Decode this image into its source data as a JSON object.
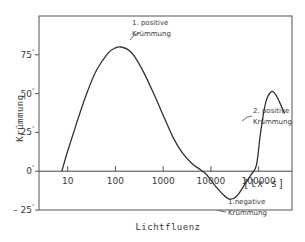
{
  "chart_data": {
    "type": "line",
    "title": "",
    "xlabel": "Lichtfluenz",
    "ylabel": "Krümmung",
    "x_unit": "[lx·s]",
    "x_scale": "log",
    "xlim": [
      2.5,
      500000
    ],
    "ylim": [
      -25,
      100
    ],
    "x_ticks": [
      10,
      100,
      1000,
      10000,
      100000
    ],
    "x_tick_labels": [
      "10",
      "100",
      "1000",
      "10000",
      "100000"
    ],
    "y_ticks": [
      -25,
      0,
      25,
      50,
      75
    ],
    "y_tick_labels": [
      "– 25",
      "0",
      "25",
      "50",
      "75"
    ],
    "y_tick_suffix": "°",
    "grid": false,
    "legend": "none",
    "series": [
      {
        "name": "Krümmung",
        "x": [
          7.5,
          10,
          15,
          25,
          40,
          70,
          100,
          130,
          180,
          250,
          400,
          700,
          1000,
          1600,
          2500,
          4000,
          6000,
          8000,
          12000,
          18000,
          25000,
          35000,
          50000,
          70000,
          90000,
          110000,
          140000,
          180000,
          220000,
          270000,
          350000
        ],
        "y": [
          0,
          13,
          30,
          50,
          65,
          76,
          79.5,
          80,
          78.5,
          74,
          63,
          47,
          36,
          22,
          12,
          5,
          1,
          -2,
          -9,
          -15,
          -18,
          -16,
          -9,
          -2,
          4,
          25,
          44,
          51,
          50,
          45,
          37
        ]
      }
    ],
    "annotations": [
      {
        "text_line1": "1. positive",
        "text_line2": "Krümmung",
        "x": 130,
        "y": 80
      },
      {
        "text_line1": "2. positive",
        "text_line2": "Krümmung",
        "x": 200000,
        "y": 51
      },
      {
        "text_line1": "1.negative",
        "text_line2": "Krümmung",
        "x": 25000,
        "y": -18
      }
    ]
  }
}
